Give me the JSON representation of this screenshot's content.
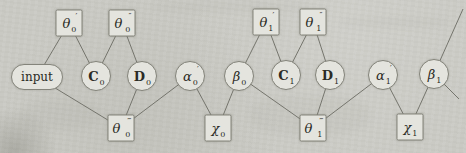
{
  "figure": {
    "type": "factor-graph",
    "colors": {
      "paper": "#c9c9c3",
      "node_fill": "#e4e4de",
      "node_border": "#84847b",
      "edge_line": "#75756d",
      "text": "#2b2b25"
    }
  },
  "nodes": [
    {
      "id": "theta0p",
      "shape": "square",
      "base": "θ",
      "prime": "′",
      "sub": "0"
    },
    {
      "id": "theta0pp",
      "shape": "square",
      "base": "θ",
      "prime": "″",
      "sub": "0"
    },
    {
      "id": "theta1p",
      "shape": "square",
      "base": "θ",
      "prime": "′",
      "sub": "1"
    },
    {
      "id": "theta1pp",
      "shape": "square",
      "base": "θ",
      "prime": "″",
      "sub": "1"
    },
    {
      "id": "input",
      "shape": "stadium",
      "base": "input",
      "prime": "",
      "sub": ""
    },
    {
      "id": "C0",
      "shape": "circle",
      "base": "C",
      "prime": "",
      "sub": "0"
    },
    {
      "id": "D0",
      "shape": "circle",
      "base": "D",
      "prime": "",
      "sub": "0"
    },
    {
      "id": "alpha0p",
      "shape": "circle",
      "base": "α",
      "prime": "′",
      "sub": "0"
    },
    {
      "id": "beta0",
      "shape": "circle",
      "base": "β",
      "prime": "",
      "sub": "0"
    },
    {
      "id": "C1",
      "shape": "circle",
      "base": "C",
      "prime": "",
      "sub": "1"
    },
    {
      "id": "D1",
      "shape": "circle",
      "base": "D",
      "prime": "",
      "sub": "1"
    },
    {
      "id": "alpha1p",
      "shape": "circle",
      "base": "α",
      "prime": "′",
      "sub": "1"
    },
    {
      "id": "beta1",
      "shape": "circle",
      "base": "β",
      "prime": "",
      "sub": "1"
    },
    {
      "id": "theta0ppp",
      "shape": "square",
      "base": "θ",
      "prime": "‴",
      "sub": "0"
    },
    {
      "id": "chi0",
      "shape": "square",
      "base": "χ",
      "prime": "",
      "sub": "0"
    },
    {
      "id": "theta1ppp",
      "shape": "square",
      "base": "θ",
      "prime": "‴",
      "sub": "1"
    },
    {
      "id": "chi1",
      "shape": "square",
      "base": "χ",
      "prime": "",
      "sub": "1"
    }
  ],
  "edges": [
    {
      "from": "theta0p",
      "to": "input"
    },
    {
      "from": "theta0p",
      "to": "C0"
    },
    {
      "from": "theta0pp",
      "to": "C0"
    },
    {
      "from": "theta0pp",
      "to": "D0"
    },
    {
      "from": "input",
      "to": "theta0ppp"
    },
    {
      "from": "D0",
      "to": "theta0ppp"
    },
    {
      "from": "alpha0p",
      "to": "theta0ppp"
    },
    {
      "from": "alpha0p",
      "to": "chi0"
    },
    {
      "from": "beta0",
      "to": "chi0"
    },
    {
      "from": "theta1p",
      "to": "beta0"
    },
    {
      "from": "theta1p",
      "to": "C1"
    },
    {
      "from": "theta1pp",
      "to": "C1"
    },
    {
      "from": "theta1pp",
      "to": "D1"
    },
    {
      "from": "beta0",
      "to": "theta1ppp"
    },
    {
      "from": "D1",
      "to": "theta1ppp"
    },
    {
      "from": "alpha1p",
      "to": "theta1ppp"
    },
    {
      "from": "alpha1p",
      "to": "chi1"
    },
    {
      "from": "beta1",
      "to": "chi1"
    },
    {
      "from": "beta1",
      "to_xy": [
        463,
        9
      ]
    },
    {
      "from": "beta1",
      "to_xy": [
        459,
        99
      ]
    }
  ]
}
